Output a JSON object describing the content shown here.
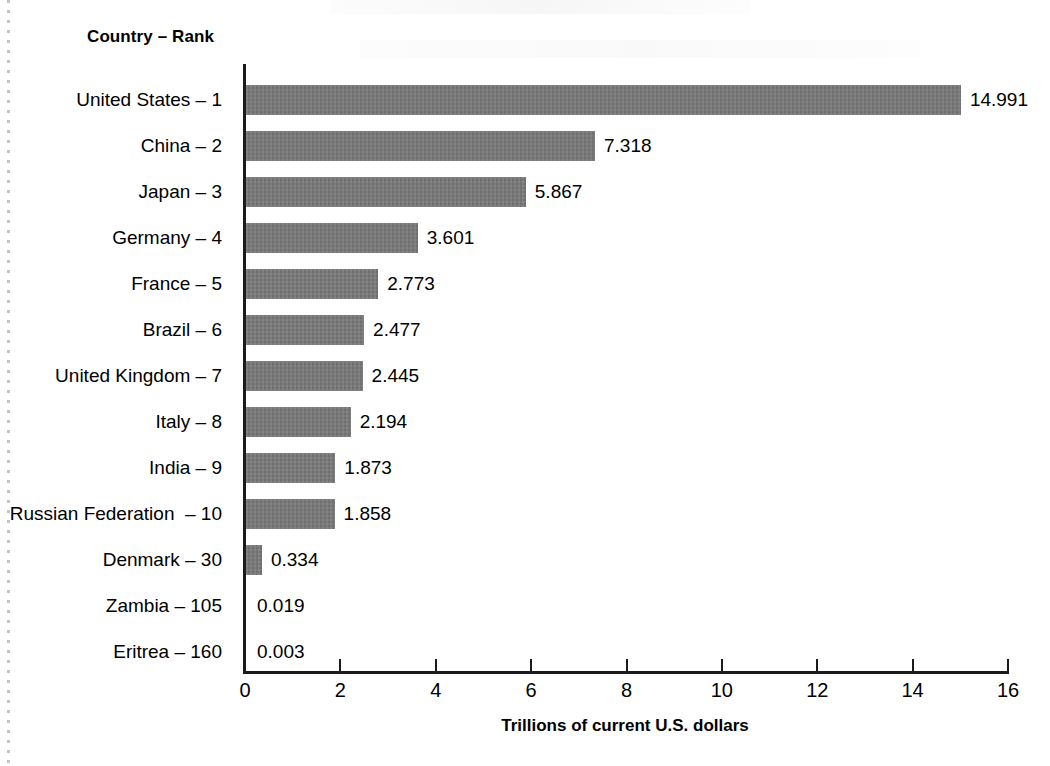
{
  "chart_data": {
    "type": "bar",
    "orientation": "horizontal",
    "title": "",
    "column_header": "Country – Rank",
    "xlabel": "Trillions of current U.S. dollars",
    "ylabel": "",
    "xlim": [
      0,
      16
    ],
    "xticks": [
      0,
      2,
      4,
      6,
      8,
      10,
      12,
      14,
      16
    ],
    "xtick_labels": [
      "0",
      "2",
      "4",
      "6",
      "8",
      "10",
      "12",
      "14",
      "16"
    ],
    "grid": false,
    "legend": false,
    "bar_color": "#787878",
    "axis_color": "#1b1b1b",
    "value_label_format": "3-decimal",
    "categories": [
      "United States – 1",
      "China – 2",
      "Japan – 3",
      "Germany – 4",
      "France – 5",
      "Brazil – 6",
      "United Kingdom – 7",
      "Italy – 8",
      "India – 9",
      "Russian Federation  – 10",
      "Denmark – 30",
      "Zambia – 105",
      "Eritrea – 160"
    ],
    "values": [
      14.991,
      7.318,
      5.867,
      3.601,
      2.773,
      2.477,
      2.445,
      2.194,
      1.873,
      1.858,
      0.334,
      0.019,
      0.003
    ],
    "value_labels": [
      "14.991",
      "7.318",
      "5.867",
      "3.601",
      "2.773",
      "2.477",
      "2.445",
      "2.194",
      "1.873",
      "1.858",
      "0.334",
      "0.019",
      "0.003"
    ],
    "countries": [
      "United States",
      "China",
      "Japan",
      "Germany",
      "France",
      "Brazil",
      "United Kingdom",
      "Italy",
      "India",
      "Russian Federation",
      "Denmark",
      "Zambia",
      "Eritrea"
    ],
    "ranks": [
      1,
      2,
      3,
      4,
      5,
      6,
      7,
      8,
      9,
      10,
      30,
      105,
      160
    ]
  }
}
